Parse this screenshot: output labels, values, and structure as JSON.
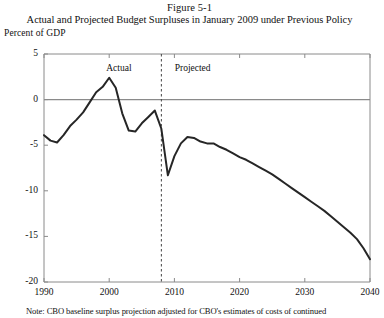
{
  "figure": {
    "number": "Figure 5-1",
    "title": "Actual and Projected Budget Surpluses in January 2009 under Previous Policy",
    "note": "Note:  CBO baseline surplus projection adjusted for CBO's estimates of costs of continued"
  },
  "chart_data": {
    "type": "line",
    "title": "Actual and Projected Budget Surpluses in January 2009 under Previous Policy",
    "xlabel": "",
    "ylabel": "Percent of GDP",
    "ylabel_text": "Percent of GDP",
    "xlim": [
      1990,
      2040
    ],
    "ylim": [
      -20,
      5
    ],
    "yticks": [
      5,
      0,
      -5,
      -10,
      -15,
      -20
    ],
    "ytick_labels": [
      "5",
      "0",
      "-5",
      "-10",
      "-15",
      "-20"
    ],
    "xticks": [
      1990,
      2000,
      2010,
      2020,
      2030,
      2040
    ],
    "xtick_labels": [
      "1990",
      "2000",
      "2010",
      "2020",
      "2030",
      "2040"
    ],
    "grid": false,
    "zero_line": 0,
    "divider_x": 2008,
    "annotations": [
      {
        "text": "Actual",
        "x": 2002,
        "y": 3.4
      },
      {
        "text": "Projected",
        "x": 2012.5,
        "y": 3.4
      }
    ],
    "legend_position": "none",
    "line_color": "#262626",
    "zero_line_color": "#8a8a8a",
    "axis_color": "#8a8a8a",
    "series": [
      {
        "name": "Budget surplus (percent of GDP)",
        "x": [
          1990,
          1991,
          1992,
          1993,
          1994,
          1995,
          1996,
          1997,
          1998,
          1999,
          2000,
          2001,
          2002,
          2003,
          2004,
          2005,
          2006,
          2007,
          2008,
          2009,
          2010,
          2011,
          2012,
          2013,
          2014,
          2015,
          2016,
          2017,
          2018,
          2019,
          2020,
          2021,
          2022,
          2023,
          2024,
          2025,
          2026,
          2027,
          2028,
          2029,
          2030,
          2031,
          2032,
          2033,
          2034,
          2035,
          2036,
          2037,
          2038,
          2039,
          2040
        ],
        "values": [
          -3.9,
          -4.5,
          -4.7,
          -3.9,
          -2.9,
          -2.2,
          -1.4,
          -0.3,
          0.8,
          1.4,
          2.4,
          1.3,
          -1.5,
          -3.4,
          -3.5,
          -2.6,
          -1.9,
          -1.2,
          -3.2,
          -8.3,
          -6.2,
          -4.8,
          -4.1,
          -4.2,
          -4.6,
          -4.8,
          -4.8,
          -5.2,
          -5.5,
          -5.9,
          -6.3,
          -6.6,
          -7.0,
          -7.4,
          -7.8,
          -8.2,
          -8.7,
          -9.2,
          -9.7,
          -10.2,
          -10.7,
          -11.2,
          -11.7,
          -12.2,
          -12.8,
          -13.4,
          -14.0,
          -14.6,
          -15.3,
          -16.3,
          -17.5
        ]
      }
    ]
  },
  "axis": {
    "y_title": "Percent of GDP"
  }
}
